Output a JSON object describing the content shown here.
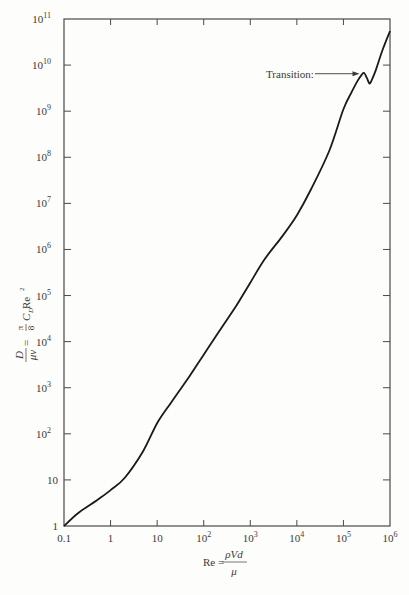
{
  "chart_data": {
    "type": "line",
    "title": "",
    "xscale": "log",
    "yscale": "log",
    "xlim": [
      0.1,
      1000000
    ],
    "ylim": [
      1,
      100000000000
    ],
    "x_ticks": [
      {
        "value": 0.1,
        "base": "0.1",
        "exp": ""
      },
      {
        "value": 1,
        "base": "1",
        "exp": ""
      },
      {
        "value": 10,
        "base": "10",
        "exp": ""
      },
      {
        "value": 100,
        "base": "10",
        "exp": "2"
      },
      {
        "value": 1000,
        "base": "10",
        "exp": "3"
      },
      {
        "value": 10000,
        "base": "10",
        "exp": "4"
      },
      {
        "value": 100000,
        "base": "10",
        "exp": "5"
      },
      {
        "value": 1000000,
        "base": "10",
        "exp": "6"
      }
    ],
    "y_ticks": [
      {
        "value": 1,
        "base": "1",
        "exp": ""
      },
      {
        "value": 10,
        "base": "10",
        "exp": ""
      },
      {
        "value": 100,
        "base": "10",
        "exp": "2"
      },
      {
        "value": 1000,
        "base": "10",
        "exp": "3"
      },
      {
        "value": 10000,
        "base": "10",
        "exp": "4"
      },
      {
        "value": 100000,
        "base": "10",
        "exp": "5"
      },
      {
        "value": 1000000,
        "base": "10",
        "exp": "6"
      },
      {
        "value": 10000000,
        "base": "10",
        "exp": "7"
      },
      {
        "value": 100000000,
        "base": "10",
        "exp": "8"
      },
      {
        "value": 1000000000,
        "base": "10",
        "exp": "9"
      },
      {
        "value": 10000000000,
        "base": "10",
        "exp": "10"
      },
      {
        "value": 100000000000,
        "base": "10",
        "exp": "11"
      }
    ],
    "xlabel": {
      "lhs": "Re = ",
      "num": "ρVd",
      "den": "μ"
    },
    "ylabel": {
      "lhs_num": "D",
      "lhs_den": "μν",
      "eq": " = ",
      "frac_num": "π",
      "frac_den": "8",
      "rhs": "C",
      "rhs_sub": "D",
      "rhs_tail": " Re",
      "rhs_sup": "2"
    },
    "grid": false,
    "series": [
      {
        "name": "D/(μν) vs Re",
        "x": [
          0.1,
          0.2,
          0.5,
          1,
          2,
          5,
          10,
          20,
          50,
          100,
          200,
          500,
          1000,
          2000,
          5000,
          10000,
          20000,
          50000,
          100000,
          150000,
          200000,
          250000,
          280000,
          320000,
          360000,
          400000,
          500000,
          700000,
          1000000
        ],
        "y": [
          1,
          1.9,
          3.6,
          6,
          11,
          42,
          170,
          480,
          1800,
          5200,
          15000,
          60000,
          190000,
          600000,
          2000000,
          5500000,
          20000000,
          140000000,
          1100000000,
          2600000000,
          4500000000,
          6300000000,
          6700000000,
          5200000000,
          4000000000,
          4600000000,
          8000000000,
          22000000000,
          55000000000
        ]
      }
    ],
    "annotations": [
      {
        "text": "Transition:",
        "arrow_to": {
          "x": 270000,
          "y": 6500000000
        }
      }
    ]
  }
}
